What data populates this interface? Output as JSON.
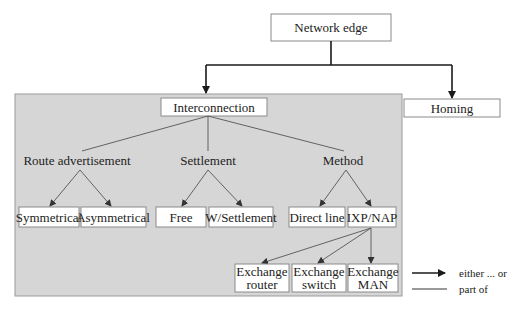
{
  "diagram": {
    "root": {
      "label": "Network edge"
    },
    "children": {
      "interconnection": {
        "label": "Interconnection"
      },
      "homing": {
        "label": "Homing"
      }
    },
    "categories": [
      {
        "label": "Route advertisement",
        "options": [
          "Symmetrical",
          "Asymmetrical"
        ]
      },
      {
        "label": "Settlement",
        "options": [
          "Free",
          "W/Settlement"
        ]
      },
      {
        "label": "Method",
        "options": [
          "Direct line",
          "IXP/NAP"
        ]
      }
    ],
    "ixp_children": [
      {
        "line1": "Exchange",
        "line2": "router"
      },
      {
        "line1": "Exchange",
        "line2": "switch"
      },
      {
        "line1": "Exchange",
        "line2": "MAN"
      }
    ],
    "legend": [
      {
        "style": "arrow",
        "label": "either ... or"
      },
      {
        "style": "line",
        "label": "part of"
      }
    ],
    "colors": {
      "panel": "#d6d6d6",
      "box": "#ffffff",
      "line": "#1a1a1a"
    }
  }
}
